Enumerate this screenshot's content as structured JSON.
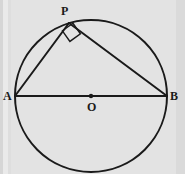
{
  "figure": {
    "kind": "geometry-diagram",
    "background_color": "#e3e3e3",
    "stroke_color": "#1a1a1a",
    "labels": {
      "A": "A",
      "B": "B",
      "P": "P",
      "O": "O"
    },
    "geometry": {
      "circle": {
        "cx": 91,
        "cy": 96,
        "r": 76,
        "stroke_width": 2.0
      },
      "points": {
        "A": {
          "x": 15,
          "y": 96
        },
        "B": {
          "x": 167,
          "y": 96
        },
        "P": {
          "x": 69,
          "y": 23
        },
        "O": {
          "x": 91,
          "y": 96
        }
      },
      "center_dot_radius": 2.2,
      "segments": [
        {
          "name": "diameter-AB",
          "from": "A",
          "to": "B",
          "stroke_width": 2.0
        },
        {
          "name": "chord-AP",
          "from": "A",
          "to": "P",
          "stroke_width": 2.0
        },
        {
          "name": "chord-PB",
          "from": "P",
          "to": "B",
          "stroke_width": 2.0
        }
      ],
      "right_angle_marker": {
        "at": "P",
        "size": 13,
        "stroke_width": 1.4,
        "points": "62.4,30.8 69.9,41.4 80.4,33.9 73.0,23.3"
      }
    }
  }
}
